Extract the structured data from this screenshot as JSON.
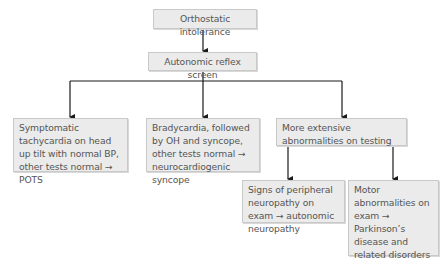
{
  "diagram": {
    "type": "flowchart",
    "nodes": {
      "root": "Orthostatic intolerance",
      "screen": "Autonomic reflex screen",
      "pots": "Symptomatic tachycardia on head up tilt with normal BP, other tests normal → POTS",
      "ncs": "Bradycardia, followed by OH and syncope, other tests normal → neurocardiogenic syncope",
      "extensive": "More extensive abnormalities on testing",
      "neuropathy": "Signs of peripheral neuropathy on exam → autonomic neuropathy",
      "parkinson": "Motor abnormalities on exam → Parkinson’s disease and related disorders"
    },
    "edges": [
      [
        "root",
        "screen"
      ],
      [
        "screen",
        "pots"
      ],
      [
        "screen",
        "ncs"
      ],
      [
        "screen",
        "extensive"
      ],
      [
        "extensive",
        "neuropathy"
      ],
      [
        "extensive",
        "parkinson"
      ]
    ],
    "colors": {
      "box_fill": "#ebebeb",
      "box_border": "#c9c9c9",
      "text": "#555555",
      "line": "#1a1a1a"
    }
  }
}
